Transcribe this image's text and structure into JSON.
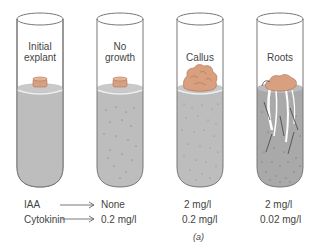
{
  "tubes": [
    {
      "label_line1": "Initial",
      "label_line2": "explant",
      "iaa": "",
      "cytokinin": ""
    },
    {
      "label_line1": "No",
      "label_line2": "growth",
      "iaa": "None",
      "cytokinin": "0.2 mg/l"
    },
    {
      "label_line1": "",
      "label_line2": "Callus",
      "iaa": "2 mg/l",
      "cytokinin": "0.2 mg/l"
    },
    {
      "label_line1": "",
      "label_line2": "Roots",
      "iaa": "2 mg/l",
      "cytokinin": "0.02 mg/l"
    }
  ],
  "legend": {
    "iaa_label": "IAA",
    "cytokinin_label": "Cytokinin"
  },
  "caption": "(a)",
  "colors": {
    "medium": "#bdbdbd",
    "explant": "#d9a07f",
    "outline": "#777777"
  }
}
